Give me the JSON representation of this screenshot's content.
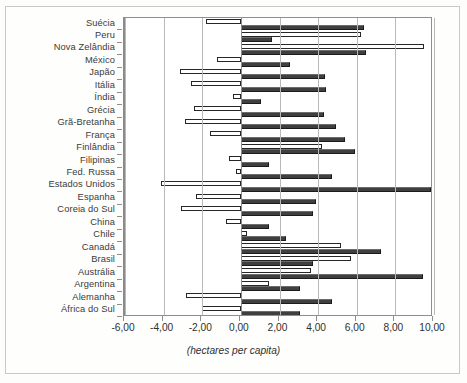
{
  "chart_data": {
    "type": "bar",
    "orientation": "horizontal",
    "title": "",
    "subtitle": "",
    "xlabel": "(hectares per capita)",
    "ylabel": "",
    "xlim": [
      -6.0,
      10.0
    ],
    "xticks": [
      -6.0,
      -4.0,
      -2.0,
      0.0,
      2.0,
      4.0,
      6.0,
      8.0,
      10.0
    ],
    "xticklabels": [
      "-6,00",
      "-4,00",
      "-2,00",
      "0,00",
      "2,00",
      "4,00",
      "6,00",
      "8,00",
      "10,00"
    ],
    "grid": true,
    "grid_axis": "x",
    "legend": false,
    "legend_position": "none",
    "decimal_separator": ",",
    "categories": [
      "Suécia",
      "Peru",
      "Nova Zelândia",
      "México",
      "Japão",
      "Itália",
      "Índia",
      "Grécia",
      "Grã-Bretanha",
      "França",
      "Finlândia",
      "Filipinas",
      "Fed. Russa",
      "Estados Unidos",
      "Espanha",
      "Coreia do Sul",
      "China",
      "Chile",
      "Canadá",
      "Brasil",
      "Austrália",
      "Argentina",
      "Alemanha",
      "África do Sul"
    ],
    "series": [
      {
        "name": "serie-clara",
        "style": "white-outlined",
        "values": [
          -1.82,
          6.2,
          9.5,
          -1.25,
          -3.15,
          -2.6,
          -0.4,
          -2.45,
          -2.9,
          -1.6,
          4.2,
          -0.62,
          -0.26,
          -4.15,
          -2.34,
          -3.1,
          -0.78,
          0.3,
          5.2,
          5.7,
          3.65,
          1.45,
          -2.85,
          -2.0
        ]
      },
      {
        "name": "serie-escura",
        "style": "dark-filled",
        "values": [
          6.4,
          1.6,
          6.5,
          2.55,
          4.35,
          4.4,
          1.05,
          4.3,
          4.95,
          5.4,
          5.9,
          1.45,
          4.7,
          9.85,
          3.9,
          3.75,
          1.45,
          2.35,
          7.25,
          3.75,
          9.45,
          3.05,
          4.7,
          3.05
        ]
      }
    ]
  }
}
